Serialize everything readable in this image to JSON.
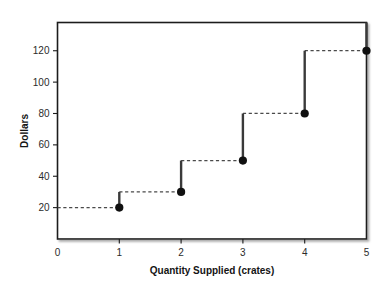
{
  "chart_data": {
    "type": "line",
    "title": "",
    "subtitle": "",
    "xlabel": "Quantity Supplied (crates)",
    "ylabel": "Dollars",
    "xlim": [
      0,
      5
    ],
    "ylim": [
      0,
      138
    ],
    "grid": false,
    "legend": null,
    "x": [
      1,
      2,
      3,
      4,
      5
    ],
    "values": [
      20,
      30,
      50,
      80,
      120
    ],
    "series": [
      {
        "name": "Supply",
        "style": "step-staircase",
        "x": [
          1,
          2,
          3,
          4,
          5
        ],
        "values": [
          20,
          30,
          50,
          80,
          120
        ]
      }
    ],
    "points": [
      {
        "x": 1,
        "y": 20,
        "label": "(1, 20)"
      },
      {
        "x": 2,
        "y": 30,
        "label": "(2, 30)"
      },
      {
        "x": 3,
        "y": 50,
        "label": "(3, 50)"
      },
      {
        "x": 4,
        "y": 80,
        "label": "(4, 80)"
      },
      {
        "x": 5,
        "y": 120,
        "label": "(5, 120)"
      }
    ],
    "risers": [
      {
        "x": 1,
        "y_from": 20,
        "y_to": 30
      },
      {
        "x": 2,
        "y_from": 30,
        "y_to": 50
      },
      {
        "x": 3,
        "y_from": 50,
        "y_to": 80
      },
      {
        "x": 4,
        "y_from": 80,
        "y_to": 120
      },
      {
        "x": 5,
        "y_from": 120,
        "y_to": 138
      }
    ],
    "treads": [
      {
        "y": 20,
        "x_from": 0,
        "x_to": 1
      },
      {
        "y": 30,
        "x_from": 1,
        "x_to": 2
      },
      {
        "y": 50,
        "x_from": 2,
        "x_to": 3
      },
      {
        "y": 80,
        "x_from": 3,
        "x_to": 4
      },
      {
        "y": 120,
        "x_from": 4,
        "x_to": 5
      }
    ],
    "xticks": [
      0,
      1,
      2,
      3,
      4,
      5
    ],
    "xtick_labels": [
      "0",
      "1",
      "2",
      "3",
      "4",
      "5"
    ],
    "yticks": [
      20,
      40,
      60,
      80,
      100,
      120
    ],
    "ytick_labels": [
      "20",
      "40",
      "60",
      "80",
      "100",
      "120"
    ],
    "colors": {
      "marker": "#101010",
      "riser": "#3a3a3a",
      "tread": "#4a4a4a",
      "frame": "#1a1a1a",
      "plot_background": "#ffffff",
      "page_background": "#ffffff",
      "text": "#141414"
    }
  }
}
